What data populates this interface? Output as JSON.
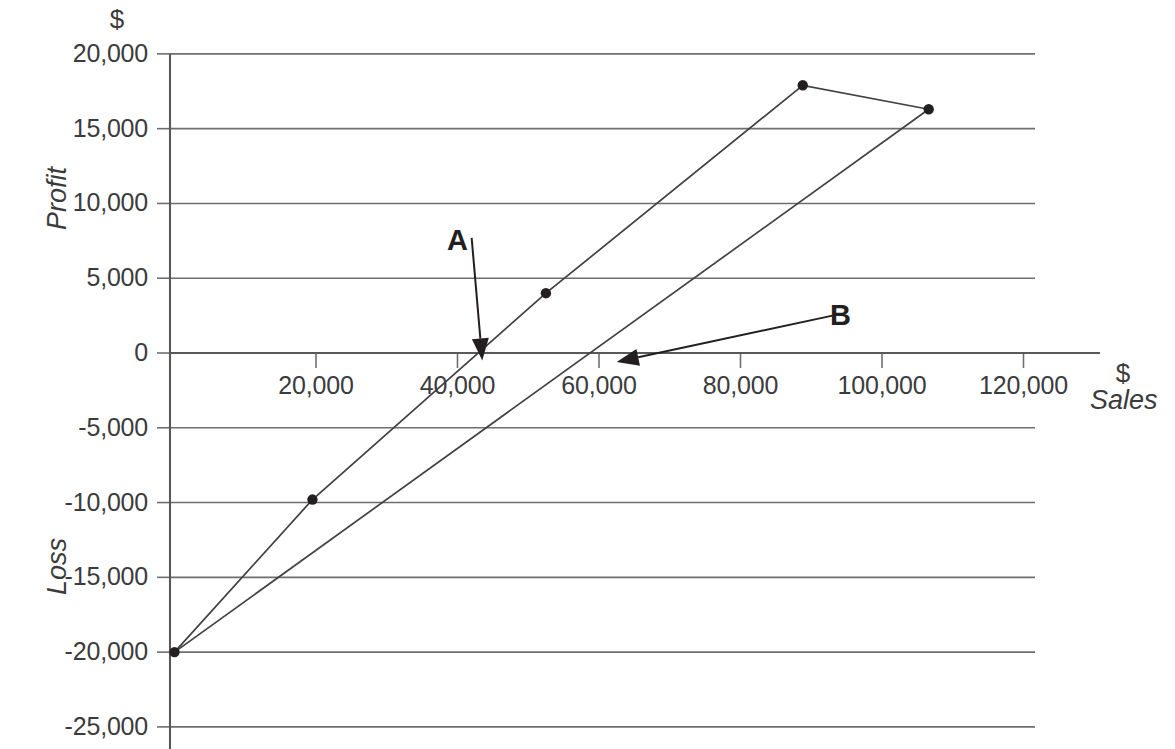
{
  "chart_data": {
    "type": "line",
    "title": "",
    "xlabel": "Sales",
    "ylabel": "Profit",
    "x_unit": "$",
    "y_unit": "$",
    "y_axis_upper_title": "Profit",
    "y_axis_lower_title": "Loss",
    "xlim": [
      0,
      125000
    ],
    "ylim": [
      -25000,
      20000
    ],
    "grid": true,
    "legend": "none",
    "x_ticks": [
      20000,
      40000,
      60000,
      80000,
      100000,
      120000
    ],
    "x_tick_labels": [
      "20,000",
      "40,000",
      "60,000",
      "80,000",
      "100,000",
      "120,000"
    ],
    "y_ticks": [
      20000,
      15000,
      10000,
      5000,
      0,
      -5000,
      -10000,
      -15000,
      -20000,
      -25000
    ],
    "y_tick_labels": [
      "20,000",
      "15,000",
      "10,000",
      "5,000",
      "0",
      "-5,000",
      "-10,000",
      "-15,000",
      "-20,000",
      "-25,000"
    ],
    "series": [
      {
        "name": "A",
        "points": [
          {
            "x": 0,
            "y": -20000
          },
          {
            "x": 19500,
            "y": -9800
          },
          {
            "x": 52500,
            "y": 4000
          },
          {
            "x": 88800,
            "y": 17900
          },
          {
            "x": 106600,
            "y": 16300
          }
        ]
      },
      {
        "name": "B",
        "points": [
          {
            "x": 0,
            "y": -20000
          },
          {
            "x": 106600,
            "y": 16300
          }
        ]
      }
    ],
    "markers": [
      {
        "x": 0,
        "y": -20000
      },
      {
        "x": 19500,
        "y": -9800
      },
      {
        "x": 52500,
        "y": 4000
      },
      {
        "x": 88800,
        "y": 17900
      },
      {
        "x": 106600,
        "y": 16300
      }
    ],
    "annotations": [
      {
        "label": "A",
        "label_x": 42000,
        "label_y": 7700,
        "tip_x": 43500,
        "tip_y": -500
      },
      {
        "label": "B",
        "label_x": 93000,
        "label_y": 2500,
        "tip_x": 62500,
        "tip_y": -600
      }
    ]
  },
  "axes": {
    "y_unit_symbol": "$",
    "x_unit_symbol": "$",
    "x_axis_name": "Sales",
    "y_axis_profit_name": "Profit",
    "y_axis_loss_name": "Loss"
  }
}
